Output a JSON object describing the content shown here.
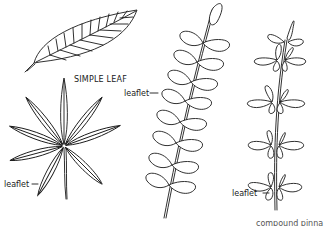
{
  "diagram": {
    "title": "",
    "figures": [
      {
        "id": "simple",
        "label": "SIMPLE LEAF"
      },
      {
        "id": "palmate",
        "label": "leaflet"
      },
      {
        "id": "pinnate",
        "label": "leaflet"
      },
      {
        "id": "bipinnate",
        "label": "leaflet"
      }
    ],
    "bottom_captions": [
      "",
      "",
      "",
      "compound pinna"
    ],
    "colors": {
      "ink": "#1a1a1a",
      "background": "#ffffff"
    }
  }
}
